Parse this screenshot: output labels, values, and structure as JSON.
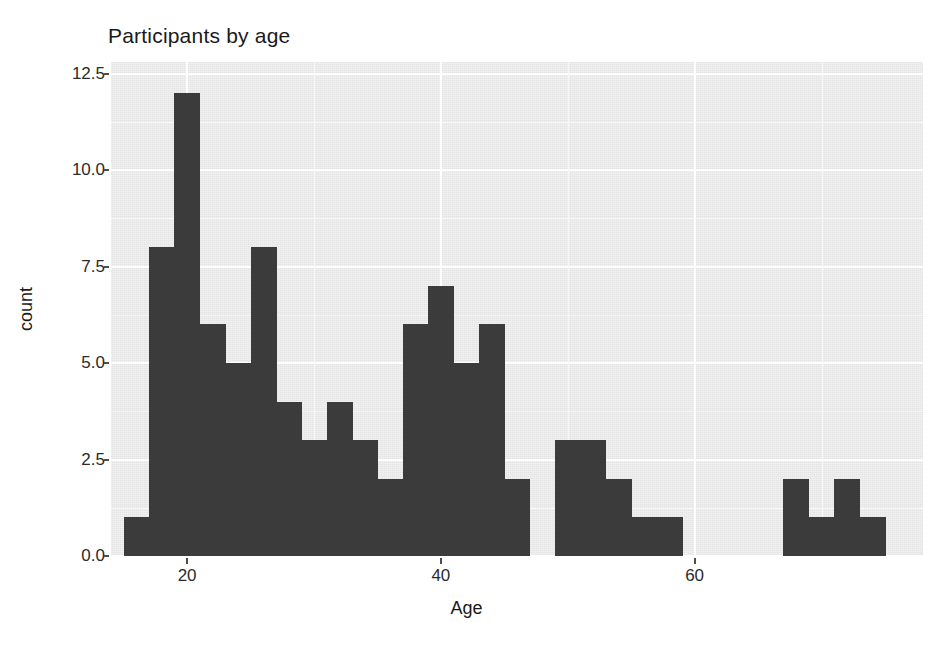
{
  "chart_data": {
    "type": "bar",
    "title": "Participants by age",
    "xlabel": "Age",
    "ylabel": "count",
    "xlim": [
      14,
      78
    ],
    "ylim": [
      0,
      12.8
    ],
    "grid": true,
    "legend": null,
    "bin_width": 2,
    "xticks": [
      20,
      40,
      60
    ],
    "xtick_labels": [
      "20",
      "40",
      "60"
    ],
    "yticks": [
      0.0,
      2.5,
      5.0,
      7.5,
      10.0,
      12.5
    ],
    "ytick_labels": [
      "0.0",
      "2.5",
      "5.0",
      "7.5",
      "10.0",
      "12.5"
    ],
    "bar_color": "#3b3b3b",
    "panel_color": "#ebebeb",
    "gridline_color": "#ffffff",
    "bin_starts": [
      15,
      17,
      19,
      21,
      23,
      25,
      27,
      29,
      31,
      33,
      35,
      37,
      39,
      41,
      43,
      45,
      49,
      51,
      53,
      55,
      57,
      67,
      69,
      71,
      73
    ],
    "values": [
      1,
      8,
      12,
      6,
      5,
      8,
      4,
      3,
      4,
      3,
      2,
      6,
      7,
      5,
      6,
      2,
      3,
      3,
      2,
      1,
      1,
      2,
      1,
      2,
      1
    ]
  },
  "axis": {
    "x_title": "Age",
    "y_title": "count"
  },
  "title": "Participants by age"
}
